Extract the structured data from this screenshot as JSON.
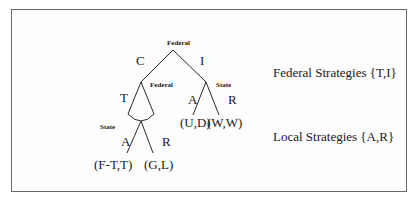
{
  "diagram": {
    "type": "extensive-form game tree",
    "nodes": {
      "root": {
        "player": "Federal"
      },
      "left": {
        "player": "Federal"
      },
      "right": {
        "player": "State"
      },
      "info_set": {
        "player": "State"
      }
    },
    "actions": {
      "root_left": "C",
      "root_right": "I",
      "left_T": "T",
      "right_A": "A",
      "right_R": "R",
      "state_A": "A",
      "state_R": "R"
    },
    "payoffs": {
      "left_A": "(F-T,T)",
      "left_R": "(G,L)",
      "right_A": "(U,D)",
      "right_R": "(W,W)"
    },
    "legend": {
      "federal": "Federal Strategies {T,I}",
      "local": "Local Strategies {A,R}"
    },
    "colors": {
      "line": "#2a2a2a",
      "frame": "#6a6a6a",
      "background": "#ffffff"
    }
  }
}
